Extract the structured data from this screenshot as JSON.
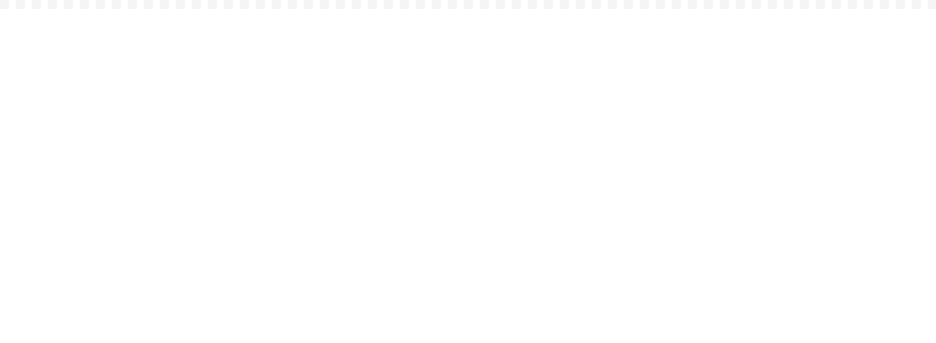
{
  "figure": {
    "panel_count": 3,
    "background_color": "#ffffff",
    "curve_color": "#121212",
    "axis_color": "#1a1a1a"
  },
  "chart_data": [
    {
      "type": "line",
      "title": "",
      "xlabel": "n_b",
      "xlabel_parts": {
        "base": "n",
        "sub": "b"
      },
      "ylabel": "",
      "xlim": [
        30,
        100
      ],
      "ylim": [
        0.0,
        1.0
      ],
      "xticks": [
        30,
        40,
        50,
        60,
        70,
        80,
        90,
        100
      ],
      "xtick_labels": [
        "30",
        "40",
        "50",
        "60",
        "70",
        "80",
        "90",
        "100"
      ],
      "yticks": [
        0.0,
        0.2,
        0.4,
        0.6,
        0.8,
        1.0
      ],
      "ytick_labels": [
        "0.0",
        "0.2",
        "0.4",
        "0.6",
        "0.8",
        "1.0"
      ],
      "grid": false,
      "legend": false,
      "caption": "n_a=20, n_ab=15, n=100, n_b=[35, 95]",
      "caption_parts": [
        {
          "base": "n",
          "sub": "a",
          "value": "=20, "
        },
        {
          "base": "n",
          "sub": "ab",
          "value": "=15, "
        },
        {
          "base": "n",
          "sub": "",
          "value": "=100, "
        },
        {
          "base": "n",
          "sub": "b",
          "value": "=[35, 95]"
        }
      ],
      "series": [
        {
          "name": "decreasing sigmoid",
          "x": [
            35,
            38,
            41,
            44,
            47,
            50,
            53,
            56,
            59,
            62,
            65,
            68,
            71,
            74,
            77,
            80,
            83,
            86,
            89,
            92,
            95
          ],
          "values": [
            1.0,
            1.0,
            0.999,
            0.998,
            0.995,
            0.99,
            0.978,
            0.957,
            0.92,
            0.862,
            0.78,
            0.672,
            0.545,
            0.41,
            0.282,
            0.172,
            0.09,
            0.038,
            0.012,
            0.002,
            0.0
          ]
        }
      ]
    },
    {
      "type": "line",
      "title": "",
      "xlabel": "n",
      "xlabel_parts": {
        "base": "n",
        "sub": ""
      },
      "ylabel": "",
      "xlim": [
        90,
        220
      ],
      "ylim": [
        0.0,
        1.0
      ],
      "xticks": [
        100,
        120,
        140,
        160,
        180,
        200,
        220
      ],
      "xtick_labels": [
        "100",
        "120",
        "140",
        "160",
        "180",
        "200",
        "220"
      ],
      "yticks": [
        0.0,
        0.2,
        0.4,
        0.6,
        0.8,
        1.0
      ],
      "ytick_labels": [
        "0.0",
        "0.2",
        "0.4",
        "0.6",
        "0.8",
        "1.0"
      ],
      "grid": false,
      "legend": false,
      "caption": "n_a=20, n_ab=15, n_b=85, n=[90, 220]",
      "caption_parts": [
        {
          "base": "n",
          "sub": "a",
          "value": "=20, "
        },
        {
          "base": "n",
          "sub": "ab",
          "value": "=15, "
        },
        {
          "base": "n",
          "sub": "b",
          "value": "=85, "
        },
        {
          "base": "n",
          "sub": "",
          "value": "=[90, 220]"
        }
      ],
      "series": [
        {
          "name": "increasing sigmoid",
          "x": [
            90,
            94,
            98,
            102,
            106,
            110,
            114,
            118,
            122,
            126,
            130,
            134,
            138,
            142,
            146,
            150,
            156,
            162,
            170,
            180,
            190,
            200
          ],
          "values": [
            0.0,
            0.012,
            0.05,
            0.12,
            0.225,
            0.36,
            0.5,
            0.625,
            0.725,
            0.8,
            0.858,
            0.9,
            0.93,
            0.952,
            0.967,
            0.978,
            0.988,
            0.994,
            0.997,
            0.999,
            1.0,
            1.0
          ]
        }
      ]
    },
    {
      "type": "line",
      "title": "",
      "xlabel": "Cardinal dilation",
      "ylabel": "",
      "xlim": [
        0,
        50
      ],
      "ylim": [
        0.5,
        1.0
      ],
      "xticks": [
        0,
        10,
        20,
        30,
        40,
        50
      ],
      "xtick_labels": [
        "0",
        "10",
        "20",
        "30",
        "40",
        "50"
      ],
      "yticks": [
        0.5,
        0.6,
        0.7,
        0.8,
        0.9,
        1.0
      ],
      "ytick_labels": [
        "0.5",
        "0.6",
        "0.7",
        "0.8",
        "0.8",
        "1.0"
      ],
      "grid": false,
      "legend": false,
      "caption": "n_a=3, n_b=5, n_ab=2, n=10",
      "caption_parts": [
        {
          "base": "n",
          "sub": "a",
          "value": "=3, "
        },
        {
          "base": "n",
          "sub": "b",
          "value": "=5, "
        },
        {
          "base": "n",
          "sub": "ab",
          "value": "=2, "
        },
        {
          "base": "n",
          "sub": "",
          "value": "=10"
        }
      ],
      "series": [
        {
          "name": "saturating rise",
          "x": [
            0,
            0.4,
            0.9,
            1.4,
            2,
            2.6,
            3.2,
            4,
            5,
            6,
            7,
            8,
            9,
            10,
            12,
            14,
            17,
            20,
            25,
            30,
            36,
            42,
            47
          ],
          "values": [
            0.5,
            0.62,
            0.72,
            0.79,
            0.845,
            0.878,
            0.9,
            0.921,
            0.942,
            0.956,
            0.966,
            0.974,
            0.98,
            0.984,
            0.99,
            0.994,
            0.997,
            0.998,
            0.999,
            1.0,
            1.0,
            1.0,
            1.0
          ]
        }
      ]
    }
  ]
}
